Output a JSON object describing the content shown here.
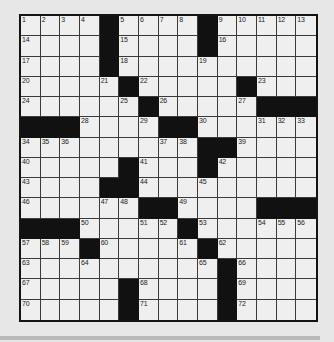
{
  "puzzle": {
    "type": "crossword",
    "rows": 15,
    "cols": 15,
    "black_cells": [
      [
        0,
        4
      ],
      [
        0,
        9
      ],
      [
        1,
        4
      ],
      [
        1,
        9
      ],
      [
        2,
        4
      ],
      [
        3,
        5
      ],
      [
        3,
        11
      ],
      [
        4,
        6
      ],
      [
        4,
        12
      ],
      [
        4,
        13
      ],
      [
        4,
        14
      ],
      [
        5,
        0
      ],
      [
        5,
        1
      ],
      [
        5,
        2
      ],
      [
        5,
        7
      ],
      [
        5,
        8
      ],
      [
        6,
        9
      ],
      [
        6,
        10
      ],
      [
        7,
        5
      ],
      [
        7,
        9
      ],
      [
        8,
        4
      ],
      [
        8,
        5
      ],
      [
        9,
        6
      ],
      [
        9,
        7
      ],
      [
        9,
        12
      ],
      [
        9,
        13
      ],
      [
        9,
        14
      ],
      [
        10,
        0
      ],
      [
        10,
        1
      ],
      [
        10,
        2
      ],
      [
        10,
        8
      ],
      [
        11,
        3
      ],
      [
        11,
        9
      ],
      [
        12,
        10
      ],
      [
        13,
        5
      ],
      [
        13,
        10
      ],
      [
        14,
        5
      ],
      [
        14,
        10
      ]
    ],
    "numbers": [
      {
        "r": 0,
        "c": 0,
        "n": "1"
      },
      {
        "r": 0,
        "c": 1,
        "n": "2"
      },
      {
        "r": 0,
        "c": 2,
        "n": "3"
      },
      {
        "r": 0,
        "c": 3,
        "n": "4"
      },
      {
        "r": 0,
        "c": 5,
        "n": "5"
      },
      {
        "r": 0,
        "c": 6,
        "n": "6"
      },
      {
        "r": 0,
        "c": 7,
        "n": "7"
      },
      {
        "r": 0,
        "c": 8,
        "n": "8"
      },
      {
        "r": 0,
        "c": 10,
        "n": "9"
      },
      {
        "r": 0,
        "c": 11,
        "n": "10"
      },
      {
        "r": 0,
        "c": 12,
        "n": "11"
      },
      {
        "r": 0,
        "c": 13,
        "n": "12"
      },
      {
        "r": 0,
        "c": 14,
        "n": "13"
      },
      {
        "r": 1,
        "c": 0,
        "n": "14"
      },
      {
        "r": 1,
        "c": 5,
        "n": "15"
      },
      {
        "r": 1,
        "c": 10,
        "n": "16"
      },
      {
        "r": 2,
        "c": 0,
        "n": "17"
      },
      {
        "r": 2,
        "c": 5,
        "n": "18"
      },
      {
        "r": 2,
        "c": 9,
        "n": "19"
      },
      {
        "r": 3,
        "c": 0,
        "n": "20"
      },
      {
        "r": 3,
        "c": 4,
        "n": "21"
      },
      {
        "r": 3,
        "c": 6,
        "n": "22"
      },
      {
        "r": 3,
        "c": 12,
        "n": "23"
      },
      {
        "r": 4,
        "c": 0,
        "n": "24"
      },
      {
        "r": 4,
        "c": 5,
        "n": "25"
      },
      {
        "r": 4,
        "c": 7,
        "n": "26"
      },
      {
        "r": 4,
        "c": 11,
        "n": "27"
      },
      {
        "r": 5,
        "c": 3,
        "n": "28"
      },
      {
        "r": 5,
        "c": 6,
        "n": "29"
      },
      {
        "r": 5,
        "c": 9,
        "n": "30"
      },
      {
        "r": 5,
        "c": 12,
        "n": "31"
      },
      {
        "r": 5,
        "c": 13,
        "n": "32"
      },
      {
        "r": 5,
        "c": 14,
        "n": "33"
      },
      {
        "r": 6,
        "c": 0,
        "n": "34"
      },
      {
        "r": 6,
        "c": 1,
        "n": "35"
      },
      {
        "r": 6,
        "c": 2,
        "n": "36"
      },
      {
        "r": 6,
        "c": 7,
        "n": "37"
      },
      {
        "r": 6,
        "c": 8,
        "n": "38"
      },
      {
        "r": 6,
        "c": 11,
        "n": "39"
      },
      {
        "r": 7,
        "c": 0,
        "n": "40"
      },
      {
        "r": 7,
        "c": 6,
        "n": "41"
      },
      {
        "r": 7,
        "c": 10,
        "n": "42"
      },
      {
        "r": 8,
        "c": 0,
        "n": "43"
      },
      {
        "r": 8,
        "c": 6,
        "n": "44"
      },
      {
        "r": 8,
        "c": 9,
        "n": "45"
      },
      {
        "r": 9,
        "c": 0,
        "n": "46"
      },
      {
        "r": 9,
        "c": 4,
        "n": "47"
      },
      {
        "r": 9,
        "c": 5,
        "n": "48"
      },
      {
        "r": 9,
        "c": 8,
        "n": "49"
      },
      {
        "r": 10,
        "c": 3,
        "n": "50"
      },
      {
        "r": 10,
        "c": 6,
        "n": "51"
      },
      {
        "r": 10,
        "c": 7,
        "n": "52"
      },
      {
        "r": 10,
        "c": 9,
        "n": "53"
      },
      {
        "r": 10,
        "c": 12,
        "n": "54"
      },
      {
        "r": 10,
        "c": 13,
        "n": "55"
      },
      {
        "r": 10,
        "c": 14,
        "n": "56"
      },
      {
        "r": 11,
        "c": 0,
        "n": "57"
      },
      {
        "r": 11,
        "c": 1,
        "n": "58"
      },
      {
        "r": 11,
        "c": 2,
        "n": "59"
      },
      {
        "r": 11,
        "c": 4,
        "n": "60"
      },
      {
        "r": 11,
        "c": 8,
        "n": "61"
      },
      {
        "r": 11,
        "c": 10,
        "n": "62"
      },
      {
        "r": 12,
        "c": 0,
        "n": "63"
      },
      {
        "r": 12,
        "c": 3,
        "n": "64"
      },
      {
        "r": 12,
        "c": 9,
        "n": "65"
      },
      {
        "r": 12,
        "c": 11,
        "n": "66"
      },
      {
        "r": 13,
        "c": 0,
        "n": "67"
      },
      {
        "r": 13,
        "c": 6,
        "n": "68"
      },
      {
        "r": 13,
        "c": 11,
        "n": "69"
      },
      {
        "r": 14,
        "c": 0,
        "n": "70"
      },
      {
        "r": 14,
        "c": 6,
        "n": "71"
      },
      {
        "r": 14,
        "c": 11,
        "n": "72"
      }
    ]
  },
  "colors": {
    "cell": "#efefef",
    "black": "#111111",
    "grid_line": "#3a3a3a",
    "background": "#e7e7e7"
  }
}
